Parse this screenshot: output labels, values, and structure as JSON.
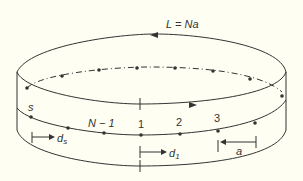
{
  "diagram": {
    "top_label": "L = Na",
    "labels": {
      "s": "s",
      "n_minus_1": "N − 1",
      "one": "1",
      "two": "2",
      "three": "3",
      "ds": "d",
      "ds_sub": "s",
      "d1": "d",
      "d1_sub": "1",
      "a": "a"
    },
    "colors": {
      "background": "#fefef2",
      "stroke": "#333333"
    }
  }
}
